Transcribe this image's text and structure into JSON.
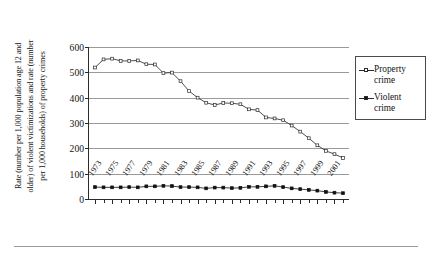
{
  "chart_data": {
    "type": "line",
    "title": "",
    "xlabel": "",
    "ylabel_lines": [
      "Rate (number per 1,000 population age 12 and",
      "older) of violent victimizations and rate (number",
      "per 1,000 households) of property crimes"
    ],
    "ylim": [
      0,
      600
    ],
    "yticks": [
      0,
      100,
      200,
      300,
      400,
      500,
      600
    ],
    "ytick_labels": [
      "0",
      "100",
      "200",
      "300",
      "400",
      "500",
      "600"
    ],
    "grid": true,
    "legend_position": "right",
    "x": [
      1973,
      1974,
      1975,
      1976,
      1977,
      1978,
      1979,
      1980,
      1981,
      1982,
      1983,
      1984,
      1985,
      1986,
      1987,
      1988,
      1989,
      1990,
      1991,
      1992,
      1993,
      1994,
      1995,
      1996,
      1997,
      1998,
      1999,
      2000,
      2001,
      2002
    ],
    "xtick_labels": [
      "1973",
      "1975",
      "1977",
      "1979",
      "1981",
      "1983",
      "1985",
      "1987",
      "1989",
      "1991",
      "1993",
      "1995",
      "1997",
      "1999",
      "2001"
    ],
    "xtick_values": [
      1973,
      1975,
      1977,
      1979,
      1981,
      1983,
      1985,
      1987,
      1989,
      1991,
      1993,
      1995,
      1997,
      1999,
      2001
    ],
    "series": [
      {
        "name": "Property crime",
        "marker": "square-open",
        "values": [
          519,
          551,
          554,
          545,
          545,
          547,
          532,
          531,
          497,
          499,
          465,
          426,
          400,
          380,
          371,
          379,
          378,
          374,
          354,
          351,
          322,
          318,
          311,
          290,
          266,
          240,
          212,
          190,
          177,
          162
        ]
      },
      {
        "name": "Violent crime",
        "marker": "square-filled",
        "values": [
          47,
          46,
          46,
          46,
          47,
          46,
          50,
          50,
          52,
          51,
          47,
          47,
          46,
          42,
          45,
          45,
          43,
          44,
          48,
          48,
          50,
          52,
          47,
          42,
          39,
          36,
          33,
          28,
          25,
          23
        ]
      }
    ]
  },
  "legend": {
    "items": [
      {
        "label_line1": "Property",
        "label_line2": "crime"
      },
      {
        "label_line1": "Violent",
        "label_line2": "crime"
      }
    ]
  }
}
